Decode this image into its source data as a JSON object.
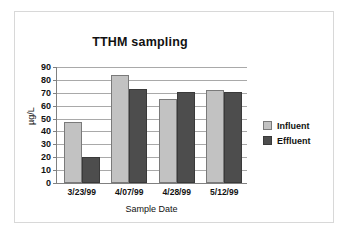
{
  "chart_data": {
    "type": "bar",
    "title": "TTHM sampling",
    "xlabel": "Sample Date",
    "ylabel": "µg/L",
    "categories": [
      "3/23/99",
      "4/07/99",
      "4/28/99",
      "5/12/99"
    ],
    "series": [
      {
        "name": "Influent",
        "color": "#c2c2c2",
        "values": [
          47,
          84,
          65,
          72
        ]
      },
      {
        "name": "Effluent",
        "color": "#4d4d4d",
        "values": [
          20,
          73,
          71,
          71
        ]
      }
    ],
    "ylim": [
      0,
      90
    ],
    "ytick_labels": [
      "90",
      "80",
      "70",
      "60",
      "50",
      "40",
      "30",
      "20",
      "10",
      "0"
    ],
    "ytick_values": [
      90,
      80,
      70,
      60,
      50,
      40,
      30,
      20,
      10,
      0
    ],
    "ytick_step": 10,
    "grid": true,
    "legend_position": "right"
  }
}
